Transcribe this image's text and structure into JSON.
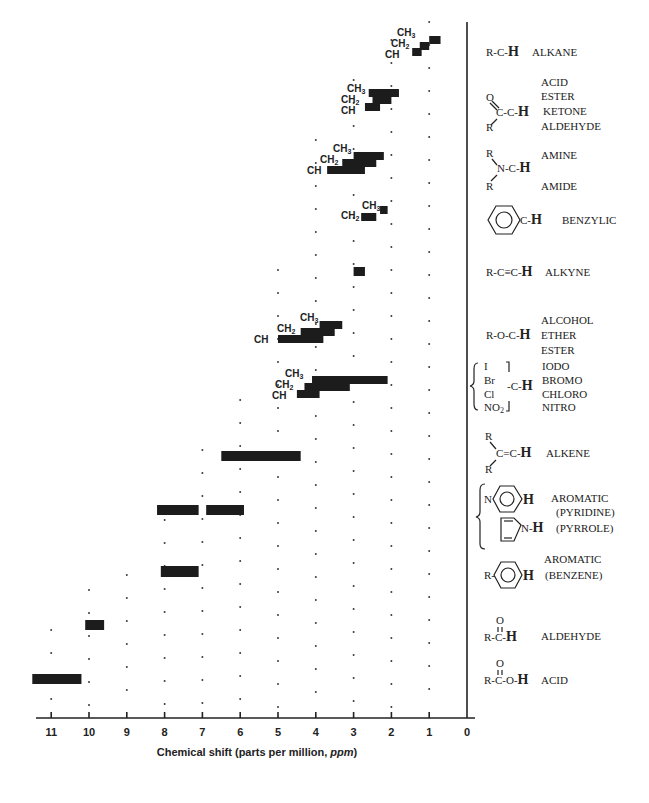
{
  "chart_data": {
    "type": "bar",
    "orientation": "horizontal-range",
    "title": "",
    "xlabel": "Chemical shift  (parts per million, ppm)",
    "ylabel": "",
    "xlim": [
      11.6,
      0
    ],
    "x_ticks": [
      11,
      10,
      9,
      8,
      7,
      6,
      5,
      4,
      3,
      2,
      1,
      0
    ],
    "grid": "dotted vertical at integer ppm",
    "legend_position": "right (structure labels)",
    "rows": [
      {
        "group": "alkane",
        "structure": "R-C-H",
        "classes": [
          "ALKANE"
        ],
        "ranges": [
          {
            "label": "CH3",
            "from": 1.0,
            "to": 0.7
          },
          {
            "label": "CH2",
            "from": 1.25,
            "to": 1.0
          },
          {
            "label": "CH",
            "from": 1.45,
            "to": 1.2
          }
        ]
      },
      {
        "group": "carbonyl-alpha",
        "structure": "O=C(R)-C-H",
        "classes": [
          "ACID",
          "ESTER",
          "KETONE",
          "ALDEHYDE"
        ],
        "ranges": [
          {
            "label": "CH3",
            "from": 2.6,
            "to": 1.8
          },
          {
            "label": "CH2",
            "from": 2.5,
            "to": 2.0
          },
          {
            "label": "CH",
            "from": 2.7,
            "to": 2.3
          }
        ]
      },
      {
        "group": "amine-amide",
        "structure": "R2N-C-H",
        "classes": [
          "AMINE",
          "AMIDE"
        ],
        "ranges": [
          {
            "label": "CH3",
            "from": 3.0,
            "to": 2.2
          },
          {
            "label": "CH2",
            "from": 3.3,
            "to": 2.4
          },
          {
            "label": "CH",
            "from": 3.7,
            "to": 2.7
          }
        ]
      },
      {
        "group": "benzylic",
        "structure": "Ph-C-H",
        "classes": [
          "BENZYLIC"
        ],
        "ranges": [
          {
            "label": "CH3",
            "from": 2.3,
            "to": 2.1
          },
          {
            "label": "CH2",
            "from": 2.8,
            "to": 2.4
          }
        ]
      },
      {
        "group": "alkyne",
        "structure": "R-C≡C-H",
        "classes": [
          "ALKYNE"
        ],
        "ranges": [
          {
            "label": "",
            "from": 3.0,
            "to": 2.7
          }
        ]
      },
      {
        "group": "alcohol-ether-ester",
        "structure": "R-O-C-H",
        "classes": [
          "ALCOHOL",
          "ETHER",
          "ESTER"
        ],
        "ranges": [
          {
            "label": "CH3",
            "from": 3.9,
            "to": 3.3
          },
          {
            "label": "CH2",
            "from": 4.4,
            "to": 3.5
          },
          {
            "label": "CH",
            "from": 5.0,
            "to": 3.8
          }
        ]
      },
      {
        "group": "halide-nitro",
        "structure": "{I, Br, Cl, NO2}-C-H",
        "classes": [
          "IODO",
          "BROMO",
          "CHLORO",
          "NITRO"
        ],
        "ranges": [
          {
            "label": "CH3",
            "from": 4.1,
            "to": 2.1
          },
          {
            "label": "CH2",
            "from": 4.3,
            "to": 3.1
          },
          {
            "label": "CH",
            "from": 4.5,
            "to": 3.9
          }
        ]
      },
      {
        "group": "alkene",
        "structure": "R2C=C-H",
        "classes": [
          "ALKENE"
        ],
        "ranges": [
          {
            "label": "",
            "from": 6.5,
            "to": 4.4
          }
        ]
      },
      {
        "group": "heteroaromatic",
        "structure": "pyridine-H / pyrrole N-H",
        "classes": [
          "AROMATIC",
          "(PYRIDINE)",
          "(PYRROLE)"
        ],
        "ranges": [
          {
            "label": "",
            "from": 8.2,
            "to": 7.1
          },
          {
            "label": "",
            "from": 6.9,
            "to": 5.9
          }
        ]
      },
      {
        "group": "benzene",
        "structure": "R-C6H4-H",
        "classes": [
          "AROMATIC",
          "(BENZENE)"
        ],
        "ranges": [
          {
            "label": "",
            "from": 8.1,
            "to": 7.1
          }
        ]
      },
      {
        "group": "aldehyde",
        "structure": "R-C(=O)-H",
        "classes": [
          "ALDEHYDE"
        ],
        "ranges": [
          {
            "label": "",
            "from": 10.1,
            "to": 9.6
          }
        ]
      },
      {
        "group": "acid",
        "structure": "R-C(=O)-O-H",
        "classes": [
          "ACID"
        ],
        "ranges": [
          {
            "label": "",
            "from": 11.5,
            "to": 10.2
          }
        ]
      }
    ]
  },
  "axis": {
    "tick_labels": [
      "11",
      "10",
      "9",
      "8",
      "7",
      "6",
      "5",
      "4",
      "3",
      "2",
      "1",
      "0"
    ],
    "title": "Chemical shift  (parts per million, ",
    "title_italic": "ppm",
    "title_close": ")"
  },
  "labels": {
    "ch3": "CH",
    "ch2": "CH",
    "ch": "CH",
    "sub3": "3",
    "sub2": "2",
    "alkane": {
      "struct": "R-C-",
      "H": "H",
      "cls": "ALKANE"
    },
    "carbonyl": {
      "O": "O",
      "C": "C-C-",
      "H": "H",
      "R": "R",
      "cls": [
        "ACID",
        "ESTER",
        "KETONE",
        "ALDEHYDE"
      ]
    },
    "amine": {
      "R1": "R",
      "N": "N-C-",
      "H": "H",
      "R2": "R",
      "cls1": "AMINE",
      "cls2": "AMIDE"
    },
    "benzylic": {
      "C": "C-",
      "H": "H",
      "cls": "BENZYLIC"
    },
    "alkyne": {
      "struct": "R-C≡C-",
      "H": "H",
      "cls": "ALKYNE"
    },
    "alcohol": {
      "struct": "R-O-C-",
      "H": "H",
      "cls": [
        "ALCOHOL",
        "ETHER",
        "ESTER"
      ]
    },
    "halide": {
      "I": "I",
      "Br": "Br",
      "Cl": "Cl",
      "NO2": "NO",
      "C": "-C-",
      "H": "H",
      "cls": [
        "IODO",
        "BROMO",
        "CHLORO",
        "NITRO"
      ]
    },
    "alkene": {
      "R1": "R",
      "C": "C=C-",
      "H": "H",
      "R2": "R",
      "cls": "ALKENE"
    },
    "pyridine": {
      "N": "N",
      "H": "H",
      "cls1": "AROMATIC",
      "cls2": "(PYRIDINE)",
      "NH": "N-",
      "NH_H": "H",
      "cls3": "(PYRROLE)"
    },
    "benzene": {
      "R": "R-",
      "H": "H",
      "cls1": "AROMATIC",
      "cls2": "(BENZENE)"
    },
    "aldehyde": {
      "O": "O",
      "struct": "R-C-",
      "H": "H",
      "cls": "ALDEHYDE"
    },
    "acid": {
      "O": "O",
      "struct": "R-C-O-",
      "H": "H",
      "cls": "ACID"
    }
  }
}
